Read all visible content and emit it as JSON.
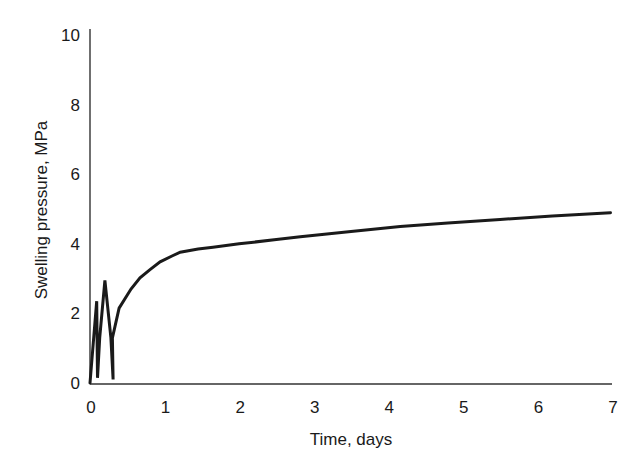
{
  "chart_data": {
    "type": "line",
    "title": "",
    "xlabel": "Time, days",
    "ylabel": "Swelling pressure, MPa",
    "xlim": [
      0,
      7
    ],
    "ylim": [
      0,
      10
    ],
    "grid": false,
    "legend": null,
    "x_ticks": [
      0,
      1,
      2,
      3,
      4,
      5,
      6,
      7
    ],
    "y_ticks": [
      0,
      2,
      4,
      6,
      8,
      10
    ],
    "series": [
      {
        "name": "Swelling pressure",
        "color": "#1a1a1a",
        "x": [
          0.0,
          0.09,
          0.1,
          0.13,
          0.2,
          0.28,
          0.31,
          0.3,
          0.39,
          0.55,
          0.67,
          0.8,
          0.94,
          1.1,
          1.21,
          1.45,
          1.65,
          2.0,
          2.5,
          2.82,
          3.5,
          4.16,
          4.8,
          5.5,
          6.2,
          6.98
        ],
        "y": [
          0.0,
          2.35,
          0.15,
          1.3,
          2.95,
          1.3,
          0.1,
          1.3,
          2.15,
          2.7,
          3.02,
          3.25,
          3.48,
          3.65,
          3.76,
          3.85,
          3.9,
          4.0,
          4.12,
          4.2,
          4.35,
          4.5,
          4.6,
          4.7,
          4.8,
          4.89
        ]
      }
    ]
  },
  "axes": {
    "xlabel": "Time, days",
    "ylabel": "Swelling pressure, MPa",
    "x_tick_labels": [
      "0",
      "1",
      "2",
      "3",
      "4",
      "5",
      "6",
      "7"
    ],
    "y_tick_labels": [
      "0",
      "2",
      "4",
      "6",
      "8",
      "10"
    ]
  }
}
